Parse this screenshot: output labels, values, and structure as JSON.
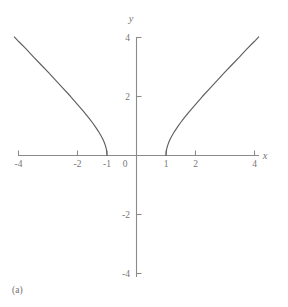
{
  "figure": {
    "caption": "(a)",
    "background_color": "#ffffff",
    "line_color": "#5f5f5f",
    "axis_color": "#8a8a8a",
    "label_color": "#777777"
  },
  "chart_data": {
    "type": "line",
    "title": "",
    "subtitle": "",
    "xlabel": "x",
    "ylabel": "y",
    "equation": "y = sqrt(x^2 - 1)",
    "xlim": [
      -4.3,
      4.3
    ],
    "ylim": [
      -4.3,
      4.3
    ],
    "grid": false,
    "legend": null,
    "x_ticks": [
      -4,
      -2,
      -1,
      0,
      1,
      2,
      4
    ],
    "x_tick_labels": [
      "-4",
      "-2",
      "-1",
      "0",
      "1",
      "2",
      "4"
    ],
    "y_ticks": [
      4,
      2,
      -2,
      -4
    ],
    "y_tick_labels": [
      "4",
      "2",
      "-2",
      "-4"
    ],
    "annotations": [
      "(a)"
    ],
    "series": [
      {
        "name": "right-branch",
        "x": [
          1.0,
          1.02,
          1.05,
          1.1,
          1.15,
          1.2,
          1.3,
          1.4,
          1.5,
          1.6,
          1.8,
          2.0,
          2.25,
          2.5,
          2.75,
          3.0,
          3.25,
          3.5,
          3.75,
          4.0,
          4.15
        ],
        "y": [
          0.0,
          0.2,
          0.32,
          0.46,
          0.57,
          0.66,
          0.83,
          0.98,
          1.12,
          1.25,
          1.5,
          1.73,
          2.02,
          2.29,
          2.56,
          2.83,
          3.09,
          3.35,
          3.62,
          3.87,
          4.03
        ]
      },
      {
        "name": "left-branch",
        "x": [
          -1.0,
          -1.02,
          -1.05,
          -1.1,
          -1.15,
          -1.2,
          -1.3,
          -1.4,
          -1.5,
          -1.6,
          -1.8,
          -2.0,
          -2.25,
          -2.5,
          -2.75,
          -3.0,
          -3.25,
          -3.5,
          -3.75,
          -4.0,
          -4.15
        ],
        "y": [
          0.0,
          0.2,
          0.32,
          0.46,
          0.57,
          0.66,
          0.83,
          0.98,
          1.12,
          1.25,
          1.5,
          1.73,
          2.02,
          2.29,
          2.56,
          2.83,
          3.09,
          3.35,
          3.62,
          3.87,
          4.03
        ]
      }
    ]
  }
}
